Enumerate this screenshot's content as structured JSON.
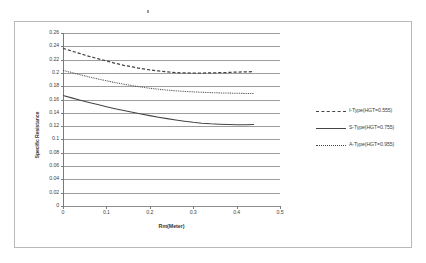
{
  "chart_data": {
    "type": "line",
    "title": "",
    "xlabel": "Rm(Meter)",
    "ylabel": "Specific Resistance",
    "xlim": [
      0,
      0.5
    ],
    "ylim": [
      0,
      0.26
    ],
    "grid": true,
    "legend_position": "right",
    "xticks": [
      "0",
      "0.1",
      "0.2",
      "0.3",
      "0.4",
      "0.5"
    ],
    "xtick_values": [
      0,
      0.1,
      0.2,
      0.3,
      0.4,
      0.5
    ],
    "yticks": [
      "0",
      "0.02",
      "0.04",
      "0.06",
      "0.08",
      "0.1",
      "0.12",
      "0.14",
      "0.16",
      "0.18",
      "0.2",
      "0.22",
      "0.24",
      "0.26"
    ],
    "ytick_values": [
      0,
      0.02,
      0.04,
      0.06,
      0.08,
      0.1,
      0.12,
      0.14,
      0.16,
      0.18,
      0.2,
      0.22,
      0.24,
      0.26
    ],
    "series": [
      {
        "name": "I-Type(HGT=0.555)",
        "style": "dashed",
        "color": "#454545",
        "x": [
          0.0,
          0.02,
          0.04,
          0.06,
          0.08,
          0.1,
          0.12,
          0.14,
          0.16,
          0.18,
          0.2,
          0.22,
          0.24,
          0.26,
          0.28,
          0.3,
          0.32,
          0.34,
          0.36,
          0.38,
          0.4,
          0.42,
          0.44
        ],
        "values": [
          0.237,
          0.233,
          0.229,
          0.225,
          0.2215,
          0.218,
          0.2145,
          0.2115,
          0.209,
          0.2065,
          0.2045,
          0.203,
          0.2015,
          0.2005,
          0.2,
          0.1998,
          0.1998,
          0.2,
          0.2003,
          0.2007,
          0.2012,
          0.2016,
          0.202
        ]
      },
      {
        "name": "S-Type(HGT=0.755)",
        "style": "solid",
        "color": "#454545",
        "x": [
          0.0,
          0.02,
          0.04,
          0.06,
          0.08,
          0.1,
          0.12,
          0.14,
          0.16,
          0.18,
          0.2,
          0.22,
          0.24,
          0.26,
          0.28,
          0.3,
          0.32,
          0.34,
          0.36,
          0.38,
          0.4,
          0.42,
          0.44
        ],
        "values": [
          0.166,
          0.1625,
          0.159,
          0.1557,
          0.1525,
          0.1493,
          0.1463,
          0.1435,
          0.1408,
          0.1382,
          0.1358,
          0.1335,
          0.1313,
          0.1293,
          0.1275,
          0.1258,
          0.1245,
          0.1235,
          0.1228,
          0.1224,
          0.1222,
          0.1222,
          0.1225
        ]
      },
      {
        "name": "A-Type(HGT=0.955)",
        "style": "dotted",
        "color": "#454545",
        "x": [
          0.0,
          0.02,
          0.04,
          0.06,
          0.08,
          0.1,
          0.12,
          0.14,
          0.16,
          0.18,
          0.2,
          0.22,
          0.24,
          0.26,
          0.28,
          0.3,
          0.32,
          0.34,
          0.36,
          0.38,
          0.4,
          0.42,
          0.44
        ],
        "values": [
          0.204,
          0.2005,
          0.1972,
          0.194,
          0.191,
          0.1882,
          0.1855,
          0.183,
          0.1808,
          0.1788,
          0.177,
          0.1755,
          0.1742,
          0.1731,
          0.1722,
          0.1715,
          0.1709,
          0.1704,
          0.17,
          0.1697,
          0.1694,
          0.1692,
          0.169
        ]
      }
    ]
  },
  "legend": {
    "items": [
      {
        "label": "I-Type(HGT=0.555)"
      },
      {
        "label": "S-Type(HGT=0.755)"
      },
      {
        "label": "A-Type(HGT=0.955)"
      }
    ]
  }
}
